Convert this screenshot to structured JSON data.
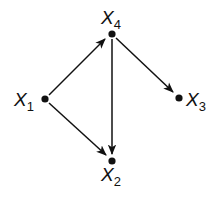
{
  "diagram": {
    "type": "directed-graph",
    "nodes": [
      {
        "id": "X1",
        "base": "X",
        "sub": "1",
        "x": 45,
        "y": 99
      },
      {
        "id": "X2",
        "base": "X",
        "sub": "2",
        "x": 112,
        "y": 161
      },
      {
        "id": "X3",
        "base": "X",
        "sub": "3",
        "x": 179,
        "y": 98
      },
      {
        "id": "X4",
        "base": "X",
        "sub": "4",
        "x": 112,
        "y": 34
      }
    ],
    "edges": [
      {
        "from": "X1",
        "to": "X4"
      },
      {
        "from": "X1",
        "to": "X2"
      },
      {
        "from": "X4",
        "to": "X2"
      },
      {
        "from": "X4",
        "to": "X3"
      }
    ],
    "colors": {
      "stroke": "#111111",
      "background": "#ffffff"
    }
  }
}
